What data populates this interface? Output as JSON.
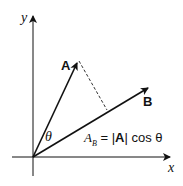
{
  "diagram": {
    "axis_x_label": "x",
    "axis_y_label": "y",
    "vector_a_label": "A",
    "vector_b_label": "B",
    "angle_label": "θ",
    "formula": {
      "lhs_main": "A",
      "lhs_sub": "B",
      "eq": " = |",
      "bold_a": "A",
      "rest": "| cos θ"
    }
  }
}
